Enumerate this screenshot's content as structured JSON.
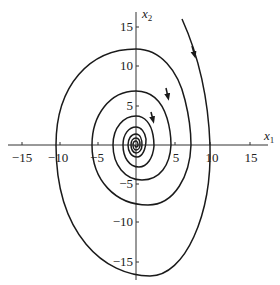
{
  "figure": {
    "type": "phase-portrait",
    "x_axis": {
      "label": "x",
      "subscript": "1",
      "ticks": [
        "−15",
        "−10",
        "−5",
        "5",
        "10",
        "15"
      ]
    },
    "y_axis": {
      "label": "x",
      "subscript": "2",
      "ticks": [
        "15",
        "10",
        "5",
        "−5",
        "−10",
        "−15"
      ]
    },
    "colors": {
      "line": "#1a1a1a",
      "background": "#ffffff"
    }
  }
}
